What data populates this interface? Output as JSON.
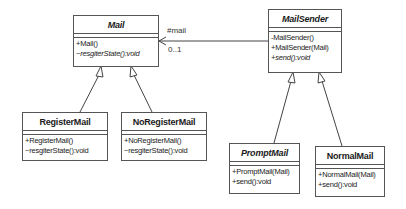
{
  "diagram": {
    "type": "uml-class-diagram",
    "classes": [
      {
        "id": "mail",
        "name": "Mail",
        "abstract": true,
        "operations": [
          {
            "text": "+Mail()",
            "abstract": false
          },
          {
            "text": "~resgiterState():void",
            "abstract": true
          }
        ]
      },
      {
        "id": "mailsender",
        "name": "MailSender",
        "abstract": true,
        "operations": [
          {
            "text": "-MailSender()",
            "abstract": false
          },
          {
            "text": "+MailSender(Mail)",
            "abstract": false
          },
          {
            "text": "+send():void",
            "abstract": true
          }
        ]
      },
      {
        "id": "registermail",
        "name": "RegisterMail",
        "abstract": false,
        "operations": [
          {
            "text": "+RegisterMail()",
            "abstract": false
          },
          {
            "text": "~resgiterState():void",
            "abstract": false
          }
        ]
      },
      {
        "id": "noregistermail",
        "name": "NoRegisterMail",
        "abstract": false,
        "operations": [
          {
            "text": "+NoRegisterMail()",
            "abstract": false
          },
          {
            "text": "~resgiterState():void",
            "abstract": false
          }
        ]
      },
      {
        "id": "promptmail",
        "name": "PromptMail",
        "abstract": true,
        "operations": [
          {
            "text": "+PromptMail(Mail)",
            "abstract": false
          },
          {
            "text": "+send():void",
            "abstract": false
          }
        ]
      },
      {
        "id": "normalmail",
        "name": "NormalMail",
        "abstract": false,
        "operations": [
          {
            "text": "+NormalMail(Mail)",
            "abstract": false
          },
          {
            "text": "+send():void",
            "abstract": false
          }
        ]
      }
    ],
    "association": {
      "from": "MailSender",
      "to": "Mail",
      "role": "#mail",
      "multiplicity": "0..1"
    },
    "generalizations": [
      {
        "child": "RegisterMail",
        "parent": "Mail"
      },
      {
        "child": "NoRegisterMail",
        "parent": "Mail"
      },
      {
        "child": "PromptMail",
        "parent": "MailSender"
      },
      {
        "child": "NormalMail",
        "parent": "MailSender"
      }
    ]
  }
}
